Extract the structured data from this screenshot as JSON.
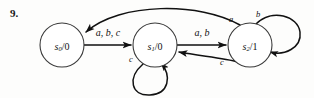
{
  "figure": {
    "problem_number": "9.",
    "type": "finite-state-machine-diagram",
    "colors": {
      "ink": "#111111",
      "node_stroke": "#3a3a3a",
      "background": "#fdfdfc"
    }
  },
  "states": [
    {
      "id": "s0",
      "name": "s",
      "subscript": "0",
      "separator": "/",
      "output": "0",
      "full_label": "s0/0",
      "cx": 62,
      "cy": 45,
      "r": 22
    },
    {
      "id": "s1",
      "name": "s",
      "subscript": "1",
      "separator": "/",
      "output": "0",
      "full_label": "s1/0",
      "cx": 155,
      "cy": 45,
      "r": 22
    },
    {
      "id": "s2",
      "name": "s",
      "subscript": "2",
      "separator": "/",
      "output": "1",
      "full_label": "s2/1",
      "cx": 250,
      "cy": 45,
      "r": 22
    }
  ],
  "transitions": [
    {
      "id": "t1",
      "from": "s0",
      "to": "s1",
      "label": "a, b, c",
      "label_x": 108,
      "label_y": 32,
      "shape": "straight"
    },
    {
      "id": "t2",
      "from": "s1",
      "to": "s2",
      "label": "a, b",
      "label_x": 202,
      "label_y": 32,
      "shape": "straight"
    },
    {
      "id": "t3",
      "from": "s1",
      "to": "s1",
      "label": "c",
      "label_x": 131,
      "label_y": 59,
      "shape": "self-loop-bottom"
    },
    {
      "id": "t4",
      "from": "s2",
      "to": "s2",
      "label": "b",
      "label_x": 258,
      "label_y": 14,
      "shape": "self-loop-right"
    },
    {
      "id": "t5",
      "from": "s2",
      "to": "s0",
      "label": "a",
      "label_x": 231,
      "label_y": 19,
      "shape": "long-arc-top"
    },
    {
      "id": "t6",
      "from": "s2",
      "to": "s1",
      "label": "c",
      "label_x": 222,
      "label_y": 62,
      "shape": "arc-bottom"
    }
  ]
}
